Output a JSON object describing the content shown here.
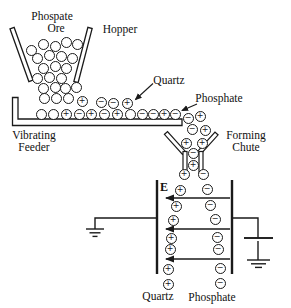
{
  "figure": {
    "labels": {
      "ore_line1": "Phospate",
      "ore_line2": "Ore",
      "hopper": "Hopper",
      "quartz_callout": "Quartz",
      "phosphate_callout": "Phosphate",
      "feeder_line1": "Vibrating",
      "feeder_line2": "Feeder",
      "chute_line1": "Forming",
      "chute_line2": "Chute",
      "field": "E",
      "output_left": "Quartz",
      "output_right": "Phosphate"
    },
    "colors": {
      "ink": "#1a1a1a",
      "background": "#ffffff"
    },
    "particles": [
      {
        "x": 31,
        "y": 50,
        "q": ""
      },
      {
        "x": 43,
        "y": 44,
        "q": ""
      },
      {
        "x": 55,
        "y": 46,
        "q": ""
      },
      {
        "x": 66,
        "y": 42,
        "q": ""
      },
      {
        "x": 77,
        "y": 44,
        "q": ""
      },
      {
        "x": 37,
        "y": 58,
        "q": ""
      },
      {
        "x": 49,
        "y": 55,
        "q": ""
      },
      {
        "x": 61,
        "y": 56,
        "q": ""
      },
      {
        "x": 72,
        "y": 58,
        "q": ""
      },
      {
        "x": 43,
        "y": 68,
        "q": ""
      },
      {
        "x": 55,
        "y": 66,
        "q": ""
      },
      {
        "x": 66,
        "y": 68,
        "q": ""
      },
      {
        "x": 37,
        "y": 78,
        "q": ""
      },
      {
        "x": 49,
        "y": 77,
        "q": ""
      },
      {
        "x": 61,
        "y": 78,
        "q": ""
      },
      {
        "x": 43,
        "y": 88,
        "q": ""
      },
      {
        "x": 55,
        "y": 87,
        "q": ""
      },
      {
        "x": 65,
        "y": 88,
        "q": ""
      },
      {
        "x": 76,
        "y": 87,
        "q": ""
      },
      {
        "x": 44,
        "y": 98,
        "q": ""
      },
      {
        "x": 56,
        "y": 98,
        "q": ""
      },
      {
        "x": 68,
        "y": 98,
        "q": ""
      },
      {
        "x": 82,
        "y": 101,
        "q": "+"
      },
      {
        "x": 101,
        "y": 102,
        "q": "−"
      },
      {
        "x": 113,
        "y": 103,
        "q": "−"
      },
      {
        "x": 127,
        "y": 103,
        "q": "+"
      },
      {
        "x": 41,
        "y": 114,
        "q": ""
      },
      {
        "x": 53,
        "y": 114,
        "q": ""
      },
      {
        "x": 66,
        "y": 114,
        "q": "+"
      },
      {
        "x": 79,
        "y": 114,
        "q": "−"
      },
      {
        "x": 91,
        "y": 114,
        "q": "+"
      },
      {
        "x": 104,
        "y": 114,
        "q": "−"
      },
      {
        "x": 117,
        "y": 114,
        "q": "+"
      },
      {
        "x": 130,
        "y": 114,
        "q": ""
      },
      {
        "x": 142,
        "y": 114,
        "q": "−"
      },
      {
        "x": 153,
        "y": 114,
        "q": "−"
      },
      {
        "x": 164,
        "y": 114,
        "q": "+"
      },
      {
        "x": 175,
        "y": 114,
        "q": "−"
      },
      {
        "x": 188,
        "y": 118,
        "q": "−"
      },
      {
        "x": 200,
        "y": 116,
        "q": "+"
      },
      {
        "x": 192,
        "y": 129,
        "q": "−"
      },
      {
        "x": 205,
        "y": 130,
        "q": "+"
      },
      {
        "x": 186,
        "y": 143,
        "q": "+"
      },
      {
        "x": 202,
        "y": 143,
        "q": "+"
      },
      {
        "x": 193,
        "y": 153,
        "q": "−"
      },
      {
        "x": 193,
        "y": 165,
        "q": "+"
      },
      {
        "x": 184,
        "y": 174,
        "q": "+"
      },
      {
        "x": 203,
        "y": 174,
        "q": "−"
      },
      {
        "x": 180,
        "y": 190,
        "q": "+"
      },
      {
        "x": 207,
        "y": 189,
        "q": "−"
      },
      {
        "x": 176,
        "y": 206,
        "q": "+"
      },
      {
        "x": 210,
        "y": 205,
        "q": "−"
      },
      {
        "x": 173,
        "y": 220,
        "q": "+"
      },
      {
        "x": 215,
        "y": 219,
        "q": "−"
      },
      {
        "x": 171,
        "y": 238,
        "q": "+"
      },
      {
        "x": 217,
        "y": 237,
        "q": "−"
      },
      {
        "x": 170,
        "y": 249,
        "q": "+"
      },
      {
        "x": 218,
        "y": 249,
        "q": "−"
      },
      {
        "x": 168,
        "y": 269,
        "q": "+"
      },
      {
        "x": 220,
        "y": 268,
        "q": "−"
      },
      {
        "x": 168,
        "y": 284,
        "q": "+"
      },
      {
        "x": 220,
        "y": 283,
        "q": "−"
      }
    ]
  }
}
